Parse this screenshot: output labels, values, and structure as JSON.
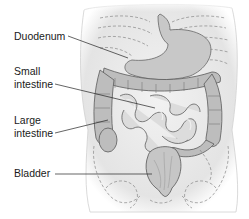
{
  "diagram": {
    "labels": [
      {
        "id": "duodenum",
        "lines": [
          "Duodenum"
        ]
      },
      {
        "id": "small-intestine",
        "lines": [
          "Small",
          "intestine"
        ]
      },
      {
        "id": "large-intestine",
        "lines": [
          "Large",
          "intestine"
        ]
      },
      {
        "id": "bladder",
        "lines": [
          "Bladder"
        ]
      }
    ]
  }
}
